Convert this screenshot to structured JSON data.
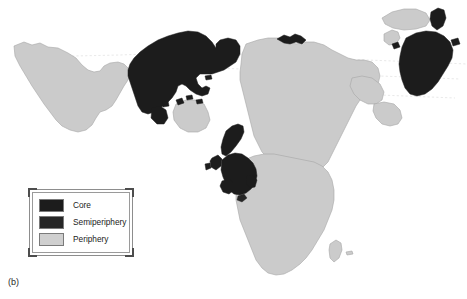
{
  "figure": {
    "caption": "(b)",
    "type": "world-map"
  },
  "legend": {
    "items": [
      {
        "label": "Core",
        "color": "#1c1c1c",
        "class": "core"
      },
      {
        "label": "Semiperiphery",
        "color": "#262626",
        "class": "semiperiphery"
      },
      {
        "label": "Periphery",
        "color": "#cfcfcf",
        "class": "periphery"
      }
    ]
  },
  "map": {
    "background_color": "#ffffff",
    "core_color": "#1c1c1c",
    "semiperiphery_color": "#262626",
    "periphery_color": "#cbcbcb",
    "outline_color": "#9b9b9b",
    "graticule_color": "#d9d9d9",
    "regions": [
      {
        "name": "south-america-landmass",
        "category": "Periphery"
      },
      {
        "name": "north-america-landmass",
        "category": "Core"
      },
      {
        "name": "central-america-landmass",
        "category": "Periphery"
      },
      {
        "name": "greenland-landmass",
        "category": "Periphery"
      },
      {
        "name": "western-europe-landmass",
        "category": "Core"
      },
      {
        "name": "scandinavia-landmass",
        "category": "Core"
      },
      {
        "name": "africa-landmass",
        "category": "Periphery"
      },
      {
        "name": "asia-landmass",
        "category": "Periphery"
      },
      {
        "name": "north-asia-coast-strip",
        "category": "Core"
      },
      {
        "name": "australia-landmass",
        "category": "Periphery"
      },
      {
        "name": "japan-east-asia-landmass",
        "category": "Core"
      },
      {
        "name": "kamchatka-landmass",
        "category": "Core"
      },
      {
        "name": "madagascar-island",
        "category": "Periphery"
      }
    ]
  }
}
